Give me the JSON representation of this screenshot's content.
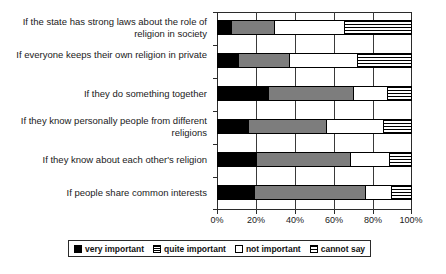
{
  "chart_data": {
    "type": "bar",
    "orientation": "horizontal",
    "stacked": true,
    "stacked_mode": "percent",
    "title": "",
    "subtitle": "",
    "xlabel": "",
    "ylabel": "",
    "xlim": [
      0,
      100
    ],
    "grid": true,
    "grid_axis": "x",
    "legend_position": "bottom",
    "xticks": [
      "0%",
      "20%",
      "40%",
      "60%",
      "80%",
      "100%"
    ],
    "xtick_values": [
      0,
      20,
      40,
      60,
      80,
      100
    ],
    "categories": [
      "If the state has strong laws about the role of religion in society",
      "If everyone keeps their own religion in private",
      "If they do something together",
      "If they know personally people from different religions",
      "If they know about each other's religion",
      "If people share common interests"
    ],
    "series": [
      {
        "name": "very important",
        "color": "#000000",
        "pattern": "solid-black",
        "values": [
          7,
          11,
          26,
          16,
          20,
          19
        ]
      },
      {
        "name": "quite important",
        "color": "#7d7d7d",
        "pattern": "gray-fill",
        "values": [
          22,
          26,
          44,
          40,
          48,
          57
        ]
      },
      {
        "name": "not important",
        "color": "#ffffff",
        "pattern": "white-fill",
        "values": [
          36,
          35,
          17,
          29,
          20,
          13
        ]
      },
      {
        "name": "cannot say",
        "color": "#ffffff",
        "pattern": "horizontal-stripes",
        "values": [
          35,
          28,
          13,
          15,
          12,
          11
        ]
      }
    ]
  },
  "legend": {
    "items": [
      {
        "label": "very important",
        "swatch": "very-important"
      },
      {
        "label": "quite important",
        "swatch": "quite-important"
      },
      {
        "label": "not important",
        "swatch": "not-important"
      },
      {
        "label": "cannot say",
        "swatch": "cannot-say"
      }
    ]
  },
  "colors": {
    "very_important": "#000000",
    "quite_important": "#7d7d7d",
    "not_important": "#ffffff",
    "cannot_say": "#ffffff",
    "axis": "#2b2b2b",
    "background": "#ffffff"
  }
}
